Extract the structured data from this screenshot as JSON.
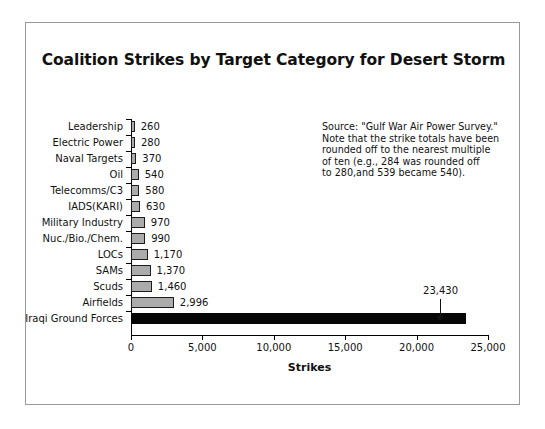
{
  "figure": {
    "title": "Coalition Strikes by Target Category for Desert Storm",
    "source_note": "Source: \"Gulf War Air Power Survey.\"\nNote that the strike totals have been\nrounded off to the nearest multiple\nof ten (e.g., 284 was rounded off\nto 280,and 539 became 540).",
    "callout_label": "23,430"
  },
  "chart_data": {
    "type": "bar",
    "orientation": "horizontal",
    "title": "Coalition Strikes by Target Category for Desert Storm",
    "xlabel": "Strikes",
    "ylabel": "",
    "xlim": [
      0,
      25000
    ],
    "xticks": [
      0,
      5000,
      10000,
      15000,
      20000,
      25000
    ],
    "xticklabels": [
      "0",
      "5,000",
      "10,000",
      "15,000",
      "20,000",
      "25,000"
    ],
    "grid": false,
    "legend": false,
    "bar_fill_color": "#ababab",
    "bar_edge_color": "#1c1c1c",
    "highlight_bar_color": "#060606",
    "categories": [
      "Leadership",
      "Electric Power",
      "Naval Targets",
      "Oil",
      "Telecomms/C3",
      "IADS(KARI)",
      "Military Industry",
      "Nuc./Bio./Chem.",
      "LOCs",
      "SAMs",
      "Scuds",
      "Airfields",
      "Iraqi Ground Forces"
    ],
    "values": [
      260,
      280,
      370,
      540,
      580,
      630,
      970,
      990,
      1170,
      1370,
      1460,
      2996,
      23430
    ],
    "value_labels": [
      "260",
      "280",
      "370",
      "540",
      "580",
      "630",
      "970",
      "990",
      "1,170",
      "1,370",
      "1,460",
      "2,996",
      "23,430"
    ],
    "annotations": [
      {
        "text": "23,430",
        "target_category": "Iraqi Ground Forces",
        "style": "arrow-down"
      }
    ]
  }
}
